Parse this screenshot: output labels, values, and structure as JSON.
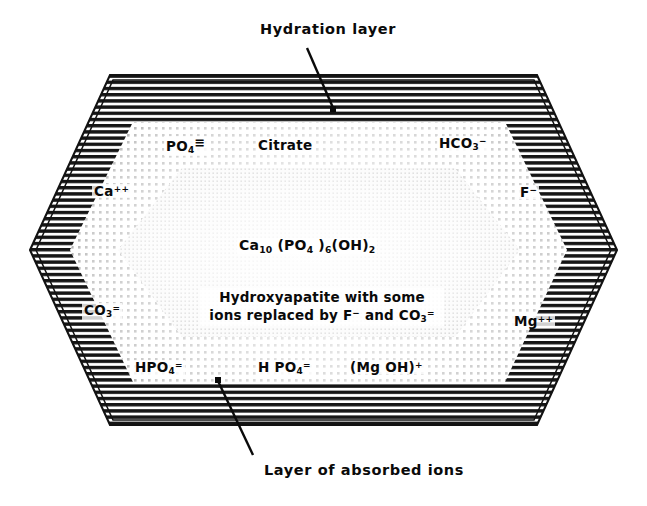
{
  "figure": {
    "background_color": "#ffffff",
    "ink_color": "#0a0a0a"
  },
  "callouts": {
    "top": {
      "label": "Hydration  layer",
      "leader": "line from text down-right into the outer hatched band"
    },
    "bottom": {
      "label": "Layer of  absorbed  ions",
      "leader": "line from text up-left into the dotted ion band"
    }
  },
  "layers": [
    {
      "name": "hydration-layer",
      "label": "Hydration  layer",
      "fill_style": "horizontal-hatch",
      "color": "#111111"
    },
    {
      "name": "absorbed-ion-layer",
      "label": "Layer of  absorbed  ions",
      "fill_style": "coarse-dot-stipple",
      "color": "#1a1a1a"
    },
    {
      "name": "crystal-core",
      "label": "Hydroxyapatite crystal",
      "fill_style": "fine-light-stipple",
      "color": "#cfcfcf"
    }
  ],
  "core": {
    "formula": {
      "element": "Ca",
      "sub1": "10",
      "mid": " (PO",
      "sub2": "4",
      "mid2": " )",
      "sub3": "6",
      "mid3": "(OH)",
      "sub4": "2",
      "plain_text": "Ca10 (PO4 )6(OH)2"
    },
    "description_line1": "Hydroxyapatite  with  some",
    "description_line2_a": "ions  replaced  by  F",
    "description_line2_sup": "−",
    "description_line2_b": "  and   CO",
    "description_line2_sub": "3",
    "description_line2_chg": "=",
    "description_plain": "Hydroxyapatite with some ions replaced by F- and CO3="
  },
  "ions": [
    {
      "name": "ion-phosphate-top",
      "base": "PO",
      "sub": "4",
      "charge": "≡",
      "charge_meaning": "3-",
      "plain": "PO4(3-)",
      "x": 164,
      "y": 136
    },
    {
      "name": "ion-citrate-top",
      "base": "Citrate",
      "sub": "",
      "charge": "",
      "charge_meaning": "",
      "plain": "Citrate",
      "x": 258,
      "y": 138
    },
    {
      "name": "ion-bicarbonate-top",
      "base": "HCO",
      "sub": "3",
      "charge": "−",
      "charge_meaning": "1-",
      "plain": "HCO3-",
      "x": 438,
      "y": 136
    },
    {
      "name": "ion-calcium-left",
      "base": "Ca",
      "sub": "",
      "charge": "++",
      "charge_meaning": "2+",
      "plain": "Ca++",
      "x": 92,
      "y": 184
    },
    {
      "name": "ion-fluoride-right",
      "base": "F",
      "sub": "",
      "charge": "−",
      "charge_meaning": "1-",
      "plain": "F-",
      "x": 518,
      "y": 185
    },
    {
      "name": "ion-carbonate-left",
      "base": "CO",
      "sub": "3",
      "charge": "=",
      "charge_meaning": "2-",
      "plain": "CO3=",
      "x": 82,
      "y": 303
    },
    {
      "name": "ion-magnesium-right",
      "base": "Mg",
      "sub": "",
      "charge": "++",
      "charge_meaning": "2+",
      "plain": "Mg++",
      "x": 512,
      "y": 314
    },
    {
      "name": "ion-hydrogen-phosphate-bottom",
      "base": "HPO",
      "sub": "4",
      "charge": "=",
      "charge_meaning": "2-",
      "plain": "HPO4=",
      "x": 135,
      "y": 360
    },
    {
      "name": "ion-dihydrogen-phosphate-bottom",
      "base": "H PO",
      "sub": "4",
      "charge": "=",
      "charge_meaning": "2-",
      "plain": "H PO4=",
      "x": 258,
      "y": 360
    },
    {
      "name": "ion-magnesium-hydroxide-bottom",
      "base": "(Mg  OH)",
      "sub": "",
      "charge": "+",
      "charge_meaning": "1+",
      "plain": "(Mg OH)+",
      "x": 350,
      "y": 360
    }
  ],
  "geometry": {
    "outer_hexagon": "110,75 537,75 617,250 537,425 110,425 30,250",
    "mid_hexagon": "133,122 505,122 567,250 505,382 133,382 70,250",
    "inner_hexagon": "182,168 455,168 520,250 455,337 182,337 118,250"
  }
}
